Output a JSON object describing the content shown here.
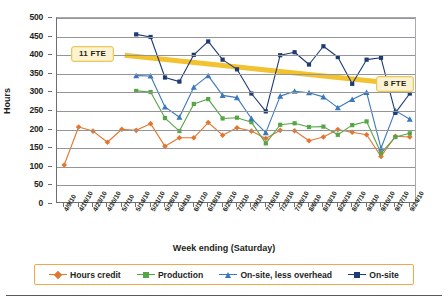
{
  "chart_data": {
    "type": "line",
    "title": "",
    "xlabel": "Week ending (Saturday)",
    "ylabel": "Hours",
    "ylim": [
      0,
      500
    ],
    "ytick_step": 50,
    "yticks": [
      0,
      50,
      100,
      150,
      200,
      250,
      300,
      350,
      400,
      450,
      500
    ],
    "grid": true,
    "legend_position": "bottom",
    "categories": [
      "4/9/10",
      "4/16/10",
      "4/23/10",
      "4/30/10",
      "5/7/10",
      "5/14/10",
      "5/21/10",
      "5/28/10",
      "6/4/10",
      "6/11/10",
      "6/18/10",
      "6/25/10",
      "7/2/10",
      "7/9/10",
      "7/16/10",
      "7/23/10",
      "7/30/10",
      "8/6/10",
      "8/13/10",
      "8/20/10",
      "8/27/10",
      "9/3/10",
      "9/10/10",
      "9/17/10",
      "9/24/10"
    ],
    "series": [
      {
        "name": "Hours credit",
        "color": "#E2762F",
        "marker": "diamond",
        "values": [
          105,
          207,
          196,
          166,
          201,
          198,
          216,
          155,
          178,
          178,
          219,
          185,
          205,
          196,
          176,
          198,
          197,
          170,
          180,
          200,
          193,
          186,
          128,
          182,
          180
        ]
      },
      {
        "name": "Production",
        "color": "#56A546",
        "marker": "square",
        "values": [
          null,
          null,
          null,
          null,
          null,
          304,
          301,
          231,
          196,
          269,
          282,
          230,
          232,
          220,
          163,
          213,
          217,
          207,
          208,
          186,
          212,
          222,
          137,
          180,
          190
        ]
      },
      {
        "name": "On-site, less overhead",
        "color": "#3B77BC",
        "marker": "triangle",
        "values": [
          null,
          null,
          null,
          null,
          null,
          345,
          344,
          261,
          233,
          314,
          345,
          292,
          286,
          230,
          192,
          290,
          303,
          299,
          288,
          259,
          281,
          300,
          150,
          251,
          228
        ]
      },
      {
        "name": "On-site",
        "color": "#1F3B73",
        "marker": "square",
        "values": [
          null,
          null,
          null,
          null,
          null,
          456,
          449,
          340,
          329,
          401,
          437,
          388,
          362,
          297,
          249,
          400,
          408,
          375,
          424,
          395,
          323,
          388,
          393,
          245,
          297
        ]
      }
    ],
    "annotations": [
      {
        "label": "11 FTE",
        "value": 400
      },
      {
        "label": "8 FTE",
        "value": 320
      }
    ],
    "trend_line": {
      "color": "#F2C231",
      "start_value": 400,
      "end_value": 320
    }
  }
}
